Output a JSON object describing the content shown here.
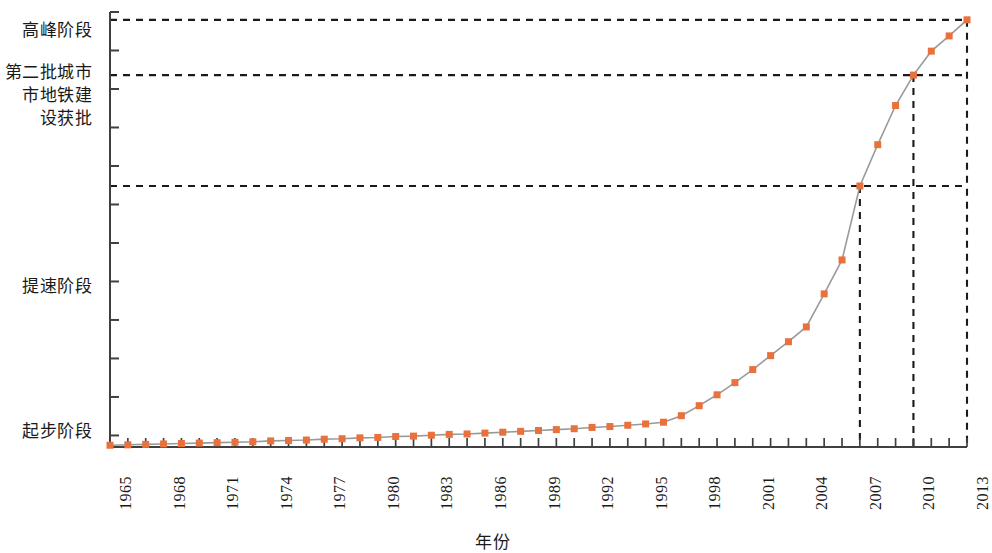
{
  "chart_data": {
    "type": "line",
    "title": "",
    "xlabel": "年份",
    "ylabel": "",
    "grid": false,
    "legend": null,
    "xlim": [
      1965,
      2013
    ],
    "ylim": [
      0,
      10
    ],
    "marker_color": "#E8713C",
    "line_color": "#9a9a9a",
    "axis_color": "#404040",
    "dash_color": "#1a1a1a",
    "x_tick_labels": [
      "1965",
      "1968",
      "1971",
      "1974",
      "1977",
      "1980",
      "1983",
      "1986",
      "1989",
      "1992",
      "1995",
      "1998",
      "2001",
      "2004",
      "2007",
      "2010",
      "2013"
    ],
    "x_tick_step_years": 3,
    "y_category_labels": [
      {
        "label": "高峰阶段",
        "value": 9.82
      },
      {
        "label": "第二批城市\n市地铁建\n设获批",
        "value": 8.3
      },
      {
        "label": "提速阶段",
        "value": 3.4
      },
      {
        "label": "起步阶段",
        "value": 0.25
      }
    ],
    "y_axis_labels": [
      "高峰阶段",
      "第二批城市",
      "市地铁建",
      "设获批",
      "提速阶段",
      "起步阶段"
    ],
    "annotation_hlines": [
      {
        "y": 9.82,
        "label": "高峰阶段"
      },
      {
        "y": 8.55,
        "label": "第二批城市地铁建设获批"
      },
      {
        "y": 6.0,
        "label": ""
      }
    ],
    "annotation_vlines": [
      {
        "x": 2007
      },
      {
        "x": 2010
      },
      {
        "x": 2013
      }
    ],
    "x": [
      1965,
      1966,
      1967,
      1968,
      1969,
      1970,
      1971,
      1972,
      1973,
      1974,
      1975,
      1976,
      1977,
      1978,
      1979,
      1980,
      1981,
      1982,
      1983,
      1984,
      1985,
      1986,
      1987,
      1988,
      1989,
      1990,
      1991,
      1992,
      1993,
      1994,
      1995,
      1996,
      1997,
      1998,
      1999,
      2000,
      2001,
      2002,
      2003,
      2004,
      2005,
      2006,
      2007,
      2008,
      2009,
      2010,
      2011,
      2012,
      2013
    ],
    "values": [
      0.04,
      0.05,
      0.06,
      0.07,
      0.08,
      0.09,
      0.1,
      0.11,
      0.12,
      0.14,
      0.15,
      0.16,
      0.18,
      0.19,
      0.21,
      0.22,
      0.24,
      0.25,
      0.27,
      0.29,
      0.3,
      0.32,
      0.34,
      0.36,
      0.38,
      0.4,
      0.42,
      0.45,
      0.47,
      0.5,
      0.53,
      0.57,
      0.72,
      0.95,
      1.2,
      1.48,
      1.78,
      2.1,
      2.42,
      2.76,
      3.52,
      4.3,
      6.0,
      6.95,
      7.85,
      8.55,
      9.1,
      9.45,
      9.82
    ],
    "series_name": "中国城市轨道交通发展阶段"
  },
  "axis": {
    "x_title": "年份"
  }
}
